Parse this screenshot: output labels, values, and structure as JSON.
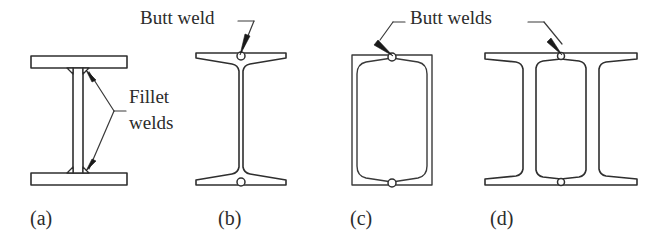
{
  "figure": {
    "background_color": "#ffffff",
    "line_color": "#2f2f2f",
    "text_color": "#2b2b2b",
    "width": 652,
    "height": 235
  },
  "annotations": [
    {
      "id": "butt-weld-b",
      "label": "Butt weld",
      "x": 140,
      "y": 24,
      "anchor": "start",
      "target": "panel-b-top-weld"
    },
    {
      "id": "fillet-welds",
      "label_line_1": "Fillet",
      "label_line_2": "welds",
      "x": 129,
      "y": 103,
      "y2": 129,
      "anchor": "start",
      "target": "panel-a-welds"
    },
    {
      "id": "butt-welds-cd",
      "label": "Butt welds",
      "x": 410,
      "y": 24,
      "anchor": "start",
      "target": "panel-c-and-d-top-welds"
    }
  ],
  "panels": [
    {
      "id": "panel-a",
      "caption": "(a)",
      "caption_x": 30,
      "caption_y": 225,
      "description": "Plate girder with fillet welds",
      "weld_type": "Fillet welds",
      "section_type": "built-up plate girder"
    },
    {
      "id": "panel-b",
      "caption": "(b)",
      "caption_x": 218,
      "caption_y": 225,
      "description": "Two tee sections joined by butt weld",
      "weld_type": "Butt weld",
      "section_type": "rolled I-section"
    },
    {
      "id": "panel-c",
      "caption": "(c)",
      "caption_x": 350,
      "caption_y": 225,
      "description": "Box section formed by two channels with butt welds",
      "weld_type": "Butt welds",
      "section_type": "box section"
    },
    {
      "id": "panel-d",
      "caption": "(d)",
      "caption_x": 490,
      "caption_y": 225,
      "description": "Two tee sections with twin webs joined by butt welds",
      "weld_type": "Butt welds",
      "section_type": "twin-web I-section"
    }
  ]
}
